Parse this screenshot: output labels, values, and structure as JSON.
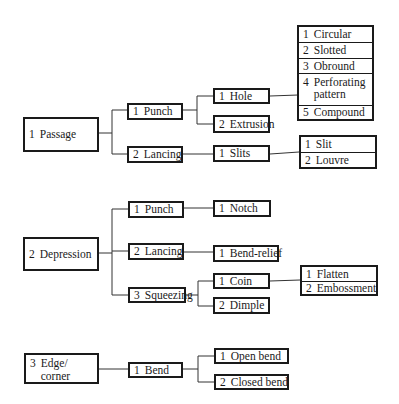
{
  "diagram": {
    "type": "classification-tree",
    "groups": [
      {
        "label": "1 Passage",
        "children": [
          {
            "label": "1 Punch",
            "children": [
              {
                "label": "1 Hole",
                "children": [
                  "1 Circular",
                  "2 Slotted",
                  "3 Obround",
                  "4 Perforating pattern",
                  "5 Compound"
                ]
              },
              {
                "label": "2 Extrusion",
                "children": []
              }
            ]
          },
          {
            "label": "2 Lancing",
            "children": [
              {
                "label": "1 Slits",
                "children": [
                  "1 Slit",
                  "2 Louvre"
                ]
              }
            ]
          }
        ]
      },
      {
        "label": "2 Depression",
        "children": [
          {
            "label": "1 Punch",
            "children": [
              {
                "label": "1 Notch",
                "children": []
              }
            ]
          },
          {
            "label": "2 Lancing",
            "children": [
              {
                "label": "1 Bend-relief",
                "children": []
              }
            ]
          },
          {
            "label": "3 Squeezing",
            "children": [
              {
                "label": "1 Coin",
                "children": [
                  "1 Flatten",
                  "2 Embossment"
                ]
              },
              {
                "label": "2 Dimple",
                "children": []
              }
            ]
          }
        ]
      },
      {
        "label": "3 Edge/ corner",
        "children": [
          {
            "label": "1 Bend",
            "children": [
              "1 Open bend",
              "2 Closed bend"
            ]
          }
        ]
      }
    ]
  },
  "nodes": {
    "passage": {
      "num": "1",
      "text": "Passage"
    },
    "passage_punch": {
      "num": "1",
      "text": "Punch"
    },
    "passage_lancing": {
      "num": "2",
      "text": "Lancing"
    },
    "hole": {
      "num": "1",
      "text": "Hole"
    },
    "extrusion": {
      "num": "2",
      "text": "Extrusion"
    },
    "slits": {
      "num": "1",
      "text": "Slits"
    },
    "hole_types": [
      {
        "num": "1",
        "text": "Circular"
      },
      {
        "num": "2",
        "text": "Slotted"
      },
      {
        "num": "3",
        "text": "Obround"
      },
      {
        "num": "4",
        "text": "Perforating pattern"
      },
      {
        "num": "5",
        "text": "Compound"
      }
    ],
    "slit_types": [
      {
        "num": "1",
        "text": "Slit"
      },
      {
        "num": "2",
        "text": "Louvre"
      }
    ],
    "depression": {
      "num": "2",
      "text": "Depression"
    },
    "depression_punch": {
      "num": "1",
      "text": "Punch"
    },
    "depression_lancing": {
      "num": "2",
      "text": "Lancing"
    },
    "squeezing": {
      "num": "3",
      "text": "Squeezing"
    },
    "notch": {
      "num": "1",
      "text": "Notch"
    },
    "bend_relief": {
      "num": "1",
      "text": "Bend-relief"
    },
    "coin": {
      "num": "1",
      "text": "Coin"
    },
    "dimple": {
      "num": "2",
      "text": "Dimple"
    },
    "coin_types": [
      {
        "num": "1",
        "text": "Flatten"
      },
      {
        "num": "2",
        "text": "Embossment"
      }
    ],
    "edge_corner": {
      "num": "3",
      "text": "Edge/ corner"
    },
    "bend": {
      "num": "1",
      "text": "Bend"
    },
    "bend_types": [
      {
        "num": "1",
        "text": "Open bend"
      },
      {
        "num": "2",
        "text": "Closed bend"
      }
    ]
  }
}
